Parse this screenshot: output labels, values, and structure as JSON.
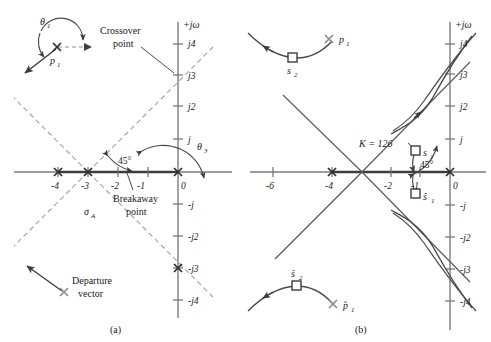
{
  "figure": {
    "panels": [
      {
        "id": "a",
        "caption": "(a)"
      },
      {
        "id": "b",
        "caption": "(b)"
      }
    ],
    "colors": {
      "axis": "#6b6b6b",
      "solid_locus": "#4a4a4a",
      "dashed_asymptote": "#9a9a9a",
      "text": "#1a1a1a",
      "marker": "#3a3a3a"
    }
  },
  "panel_a": {
    "caption": "(a)",
    "axis": {
      "imag_label": "+jω",
      "real_ticks": [
        "-4",
        "-3",
        "-2",
        "-1",
        "0"
      ],
      "real_tick_values": [
        -4,
        -3,
        -2,
        -1,
        0
      ],
      "imag_ticks_pos": [
        "j4",
        "j3",
        "j2",
        "j"
      ],
      "imag_tick_pos_values": [
        4,
        3,
        2,
        1
      ],
      "imag_ticks_neg": [
        "-j",
        "-j2",
        "-j3",
        "-j4"
      ],
      "imag_tick_neg_values": [
        -1,
        -2,
        -3,
        -4
      ]
    },
    "annotations": {
      "theta1": "θ",
      "theta1_sub": "1",
      "theta3": "θ",
      "theta3_sub": "3",
      "pole1": "p",
      "pole1_sub": "1",
      "sigma_a": "σ",
      "sigma_a_sub": "A",
      "angle_45": "45°",
      "crossover_line1": "Crossover",
      "crossover_line2": "point",
      "breakaway_line1": "Breakaway",
      "breakaway_line2": "point",
      "departure_line1": "Departure",
      "departure_line2": "vector"
    },
    "poles": [
      {
        "name": "pole-real-minus4",
        "re": -4,
        "im": 0,
        "glyph": "x"
      },
      {
        "name": "pole-real-minus3",
        "re": -3,
        "im": 0,
        "glyph": "x"
      },
      {
        "name": "pole-origin",
        "re": 0,
        "im": 0,
        "glyph": "x"
      },
      {
        "name": "pole-complex-upper",
        "re": -3.65,
        "im": 3.3,
        "glyph": "x"
      },
      {
        "name": "pole-complex-lower",
        "re": 0,
        "im": -3,
        "glyph": "x"
      }
    ],
    "key_points": {
      "centroid_sigma_a": -3,
      "breakaway_point": -1.35,
      "crossover_point_imag": 3,
      "asymptote_angle_deg": 45
    }
  },
  "panel_b": {
    "caption": "(b)",
    "axis": {
      "imag_label": "+jω",
      "real_ticks": [
        "-6",
        "-4",
        "-2",
        "-1",
        "0"
      ],
      "real_tick_values": [
        -6,
        -4,
        -2,
        -1,
        0
      ],
      "imag_ticks_pos": [
        "j4",
        "j3",
        "j2",
        "j"
      ],
      "imag_tick_pos_values": [
        4,
        3,
        2,
        1
      ],
      "imag_ticks_neg": [
        "-j",
        "-j2",
        "-j3",
        "-j4"
      ],
      "imag_tick_neg_values": [
        -1,
        -2,
        -3,
        -4
      ]
    },
    "annotations": {
      "gain_label": "K = 126",
      "gain_value": 126,
      "s1": "s",
      "s1_sub": "1",
      "s1_hat": "ŝ",
      "s1_hat_sub": "1",
      "s2": "s",
      "s2_sub": "2",
      "s2_hat": "ŝ",
      "s2_hat_sub": "2",
      "p1": "p",
      "p1_sub": "1",
      "p1_hat": "p̂",
      "p1_hat_sub": "1",
      "angle_45": "45°"
    },
    "poles": [
      {
        "name": "pole-real-minus4",
        "re": -4,
        "im": 0,
        "glyph": "x"
      },
      {
        "name": "pole-origin",
        "re": 0,
        "im": 0,
        "glyph": "x"
      },
      {
        "name": "pole-p1-upper",
        "re": -4.2,
        "im": 4.5,
        "glyph": "x"
      },
      {
        "name": "pole-p1-lower",
        "re": -4.2,
        "im": -4.5,
        "glyph": "x"
      }
    ],
    "roots": [
      {
        "name": "root-s1",
        "label": "s1",
        "re": -1.05,
        "im": 1.6,
        "glyph": "square"
      },
      {
        "name": "root-s1-hat",
        "label": "s1-hat",
        "re": -1.05,
        "im": -1.6,
        "glyph": "square"
      },
      {
        "name": "root-s2",
        "label": "s2",
        "re": -5.3,
        "im": 5.2,
        "glyph": "square"
      },
      {
        "name": "root-s2-hat",
        "label": "s2-hat",
        "re": -5.3,
        "im": -5.2,
        "glyph": "square"
      }
    ],
    "key_points": {
      "gain": 126,
      "damping_line_angle_deg": 45,
      "crossover_imag": 3
    }
  }
}
